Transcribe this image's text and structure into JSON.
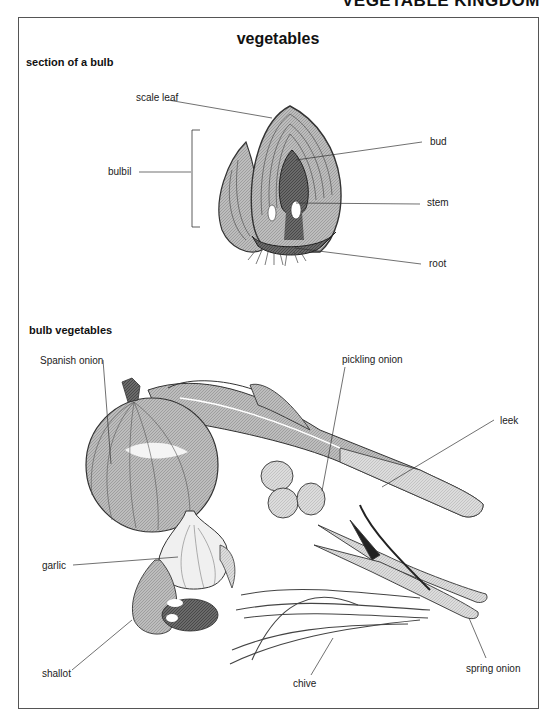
{
  "page": {
    "running_head": "VEGETABLE KINGDOM",
    "title": "vegetables"
  },
  "sections": [
    {
      "heading": "section of a bulb",
      "labels": {
        "scale_leaf": "scale leaf",
        "bulbil": "bulbil",
        "bud": "bud",
        "stem": "stem",
        "root": "root"
      }
    },
    {
      "heading": "bulb vegetables",
      "labels": {
        "spanish_onion": "Spanish onion",
        "pickling_onion": "pickling onion",
        "leek": "leek",
        "garlic": "garlic",
        "shallot": "shallot",
        "chive": "chive",
        "spring_onion": "spring onion"
      }
    }
  ]
}
